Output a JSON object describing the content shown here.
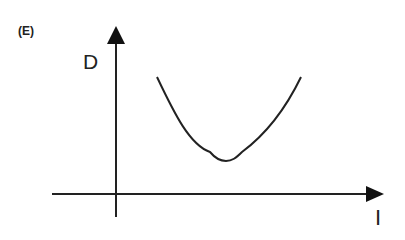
{
  "figure": {
    "panel_label": "(E)",
    "y_axis_label": "D",
    "x_axis_label": "I",
    "curve_shape": "U-shaped (minimum at intermediate I)",
    "line_color": "#222222",
    "background": "#ffffff"
  }
}
